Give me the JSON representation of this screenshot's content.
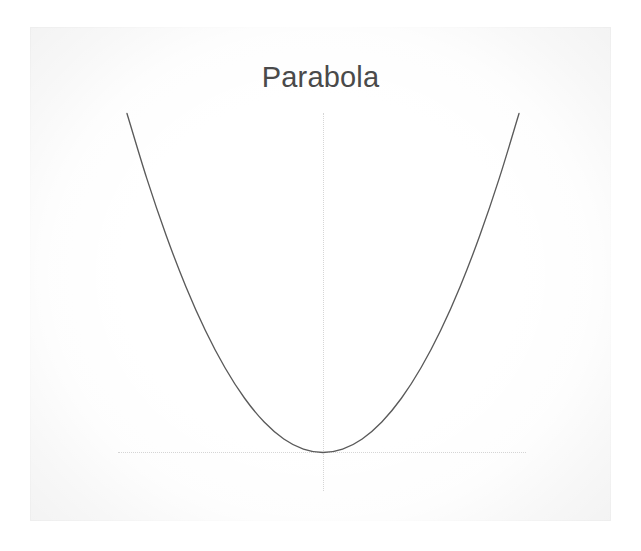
{
  "figure": {
    "title": "Parabola",
    "background_color": "#ffffff",
    "canvas_color": "#f2f2f2",
    "curve_color": "#5a5a5a",
    "axis_color": "#cfcfcf",
    "title_color": "#4a4a4a"
  },
  "chart_data": {
    "type": "line",
    "title": "Parabola",
    "xlabel": "",
    "ylabel": "",
    "grid": false,
    "legend": "none",
    "axis_style": "dotted crosshair through vertex",
    "xlim": [
      -10,
      10
    ],
    "ylim": [
      0,
      100
    ],
    "equation": "y = x^2",
    "vertex": [
      0,
      0
    ],
    "x": [
      -10,
      -9,
      -8,
      -7,
      -6,
      -5,
      -4,
      -3,
      -2,
      -1,
      0,
      1,
      2,
      3,
      4,
      5,
      6,
      7,
      8,
      9,
      10
    ],
    "series": [
      {
        "name": "y = x^2",
        "values": [
          100,
          81,
          64,
          49,
          36,
          25,
          16,
          9,
          4,
          1,
          0,
          1,
          4,
          9,
          16,
          25,
          36,
          49,
          64,
          81,
          100
        ]
      }
    ],
    "xticks": [],
    "yticks": [],
    "xticklabels": [],
    "yticklabels": []
  }
}
